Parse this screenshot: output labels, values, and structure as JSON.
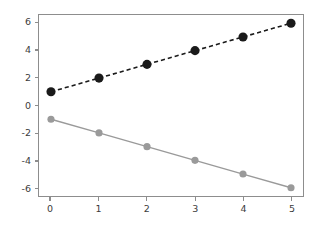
{
  "figure": {
    "width": 319,
    "height": 227,
    "background_color": "#ffffff"
  },
  "axes": {
    "spine_color": "#8d8d8d",
    "tick_label_color": "#3c3c3c",
    "grid": "off",
    "legend": "none"
  },
  "chart_data": {
    "type": "line",
    "title": "",
    "xlabel": "",
    "ylabel": "",
    "xlim": [
      -0.25,
      5.25
    ],
    "ylim": [
      -6.6,
      6.6
    ],
    "xticks": [
      0,
      1,
      2,
      3,
      4,
      5
    ],
    "yticks": [
      6,
      4,
      2,
      0,
      -2,
      -4,
      -6
    ],
    "xtick_labels": [
      "0",
      "1",
      "2",
      "3",
      "4",
      "5"
    ],
    "ytick_labels": [
      "6",
      "4",
      "2",
      "0",
      "-2",
      "-4",
      "-6"
    ],
    "grid": false,
    "legend_position": "none",
    "x": [
      0,
      1,
      2,
      3,
      4,
      5
    ],
    "series": [
      {
        "name": "upper-series",
        "values": [
          1,
          2,
          3,
          4,
          5,
          6
        ],
        "color": "#1a1a1a",
        "linestyle": "dashed",
        "linewidth": 1.6,
        "marker": "circle",
        "marker_size": 4.6,
        "marker_color": "#1a1a1a"
      },
      {
        "name": "lower-series",
        "values": [
          -1,
          -2,
          -3,
          -4,
          -5,
          -6
        ],
        "color": "#9a9a9a",
        "linestyle": "solid",
        "linewidth": 1.4,
        "marker": "circle",
        "marker_size": 3.6,
        "marker_color": "#9a9a9a"
      }
    ]
  }
}
